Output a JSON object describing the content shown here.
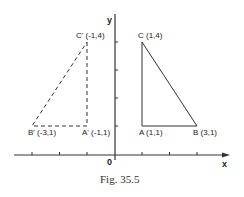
{
  "figure": {
    "caption": "Fig. 35.5",
    "axes": {
      "x_label": "x",
      "y_label": "y",
      "origin_label": "0",
      "x_ticks": [
        -3,
        -2,
        -1,
        0,
        1,
        2,
        3
      ],
      "y_ticks": [
        1,
        2,
        3,
        4
      ]
    },
    "triangle_original": {
      "style": "solid",
      "vertices": [
        {
          "name": "A",
          "label": "A (1,1)",
          "x": 1,
          "y": 1
        },
        {
          "name": "B",
          "label": "B (3,1)",
          "x": 3,
          "y": 1
        },
        {
          "name": "C",
          "label": "C (1,4)",
          "x": 1,
          "y": 4
        }
      ]
    },
    "triangle_image": {
      "style": "dashed",
      "vertices": [
        {
          "name": "A'",
          "label": "A' (-1,1)",
          "x": -1,
          "y": 1
        },
        {
          "name": "B'",
          "label": "B' (-3,1)",
          "x": -3,
          "y": 1
        },
        {
          "name": "C'",
          "label": "C' (-1,4)",
          "x": -1,
          "y": 4
        }
      ]
    },
    "colors": {
      "line": "#333333",
      "text": "#222222",
      "background": "#ffffff"
    }
  }
}
